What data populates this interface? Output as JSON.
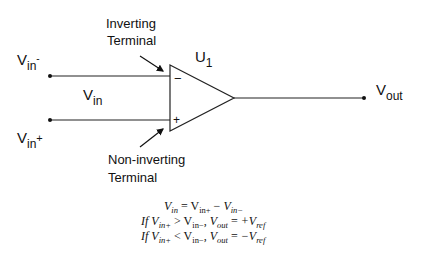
{
  "diagram": {
    "type": "op-amp comparator schematic",
    "component": {
      "name": "U",
      "subscript": "1"
    },
    "labels": {
      "inverting_terminal": [
        "Inverting",
        "Terminal"
      ],
      "non_inverting_terminal": [
        "Non-inverting",
        "Terminal"
      ],
      "vin_minus": {
        "main": "V",
        "sub": "in",
        "sup": "-"
      },
      "vin_plus": {
        "main": "V",
        "sub": "in",
        "sup": "+"
      },
      "vin": {
        "main": "V",
        "sub": "in"
      },
      "vout": {
        "main": "V",
        "sub": "out"
      },
      "minus_sign": "−",
      "plus_sign": "+"
    },
    "equations": [
      "V_in = V_in+ − V_in−",
      "If V_in+ > V_in−, V_out = +V_ref",
      "If V_in+ < V_in−, V_out = −V_ref"
    ],
    "eq_parts": {
      "V": "V",
      "in": "in",
      "inp": "in+",
      "inm": "in−",
      "out": "out",
      "ref": "ref",
      "if": "If",
      "eq": " = ",
      "minus": " − ",
      "gt": " > ",
      "lt": " < ",
      "comma": ", ",
      "plusV": "+V",
      "minusV": "−V"
    },
    "colors": {
      "stroke": "#111111",
      "background": "#ffffff"
    }
  }
}
